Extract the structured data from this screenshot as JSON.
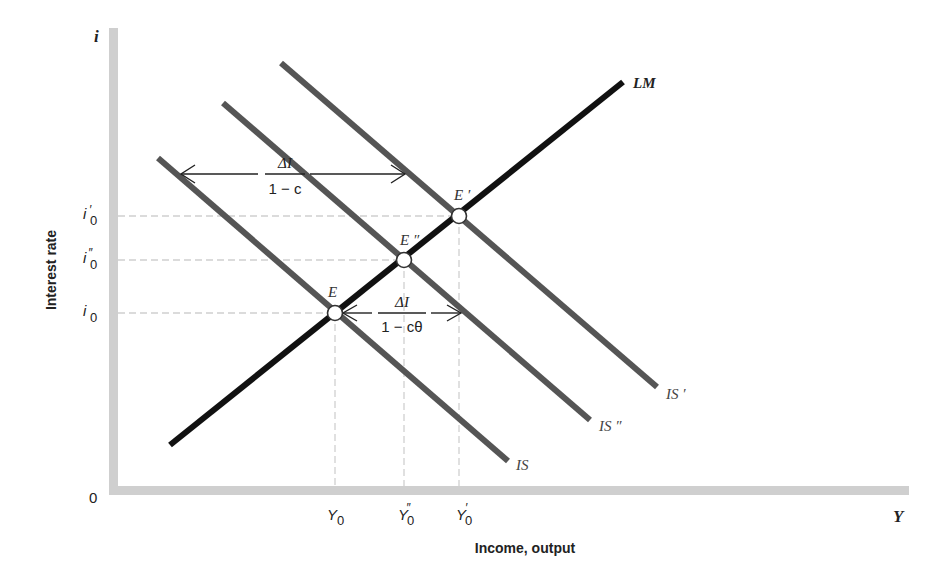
{
  "diagram": {
    "y_axis": {
      "symbol": "i",
      "label": "Interest rate"
    },
    "x_axis": {
      "symbol": "Y",
      "label": "Income, output",
      "origin": "0"
    },
    "y_ticks": [
      {
        "main": "i",
        "prime": "′",
        "sub": "0",
        "y": 216
      },
      {
        "main": "i",
        "prime": "″",
        "sub": "0",
        "y": 260
      },
      {
        "main": "i",
        "prime": "",
        "sub": "0",
        "y": 313
      }
    ],
    "x_ticks": [
      {
        "main": "Y",
        "prime": "",
        "sub": "0",
        "x": 335
      },
      {
        "main": "Y",
        "prime": "″",
        "sub": "0",
        "x": 404
      },
      {
        "main": "Y",
        "prime": "′",
        "sub": "0",
        "x": 459
      }
    ],
    "curves": {
      "lm": {
        "label": "LM",
        "color": "#111111"
      },
      "is": {
        "label": "IS",
        "color": "#555555"
      },
      "is_double_prime": {
        "label": "IS ″",
        "color": "#555555"
      },
      "is_prime": {
        "label": "IS ′",
        "color": "#555555"
      }
    },
    "equilibria": {
      "e": {
        "label": "E"
      },
      "e_double_prime": {
        "label": "E ″"
      },
      "e_prime": {
        "label": "E ′"
      }
    },
    "multipliers": {
      "simple": {
        "numerator": "ΔI",
        "denominator": "1 − c"
      },
      "with_money": {
        "numerator": "ΔI",
        "denominator": "1 − cθ"
      }
    },
    "colors": {
      "axis": "#cfcfcf",
      "guide": "#d0d0d0",
      "lm": "#111111",
      "is": "#555555",
      "text": "#222222"
    }
  }
}
